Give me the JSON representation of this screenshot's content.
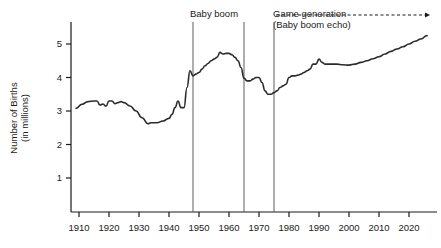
{
  "chart_data": {
    "type": "line",
    "title": "",
    "xlabel": "",
    "ylabel": "Number of Births\n(in millions)",
    "ylabel_lines": [
      "Number of Births",
      "(in millions)"
    ],
    "xlim": [
      1909,
      2027
    ],
    "ylim": [
      0,
      5.6
    ],
    "xticks": [
      1910,
      1920,
      1930,
      1940,
      1950,
      1960,
      1970,
      1980,
      1990,
      2000,
      2010,
      2020
    ],
    "xtick_labels": [
      "1910",
      "1920",
      "1930",
      "1940",
      "1950",
      "1960",
      "1970",
      "1980",
      "1990",
      "2000",
      "2010",
      "2020"
    ],
    "yticks": [
      1,
      2,
      3,
      4,
      5
    ],
    "ytick_labels": [
      "1",
      "2",
      "3",
      "4",
      "5"
    ],
    "grid": false,
    "legend": "none",
    "line_color": "#2b2b2b",
    "marker_line_color": "#6b6b6b",
    "series": [
      {
        "name": "Number of Births (in millions)",
        "x": [
          1909,
          1911,
          1913,
          1915,
          1916,
          1917,
          1918,
          1919,
          1920,
          1921,
          1922,
          1923,
          1924,
          1925,
          1927,
          1929,
          1931,
          1933,
          1934,
          1936,
          1938,
          1940,
          1941,
          1942,
          1943,
          1944,
          1945,
          1946,
          1947,
          1948,
          1949,
          1950,
          1951,
          1952,
          1953,
          1954,
          1955,
          1956,
          1957,
          1958,
          1959,
          1960,
          1961,
          1962,
          1963,
          1964,
          1965,
          1966,
          1967,
          1968,
          1969,
          1970,
          1971,
          1972,
          1973,
          1974,
          1975,
          1976,
          1977,
          1978,
          1979,
          1980,
          1981,
          1982,
          1983,
          1984,
          1985,
          1986,
          1987,
          1988,
          1989,
          1990,
          1991,
          1992,
          1994,
          1996,
          1998,
          2000,
          2002,
          2004,
          2006,
          2008,
          2010,
          2012,
          2014,
          2016,
          2018,
          2020,
          2022,
          2024,
          2026
        ],
        "y": [
          3.08,
          3.2,
          3.28,
          3.3,
          3.3,
          3.18,
          3.21,
          3.14,
          3.3,
          3.3,
          3.22,
          3.25,
          3.28,
          3.25,
          3.15,
          3.0,
          2.8,
          2.62,
          2.65,
          2.65,
          2.7,
          2.78,
          2.9,
          3.1,
          3.3,
          3.1,
          3.1,
          3.7,
          4.2,
          4.05,
          4.1,
          4.15,
          4.25,
          4.35,
          4.42,
          4.5,
          4.55,
          4.6,
          4.75,
          4.7,
          4.72,
          4.72,
          4.68,
          4.6,
          4.5,
          4.3,
          3.98,
          3.9,
          3.9,
          3.95,
          4.0,
          4.0,
          3.85,
          3.6,
          3.5,
          3.5,
          3.55,
          3.6,
          3.7,
          3.75,
          3.8,
          4.0,
          4.05,
          4.05,
          4.07,
          4.1,
          4.15,
          4.2,
          4.25,
          4.4,
          4.4,
          4.55,
          4.45,
          4.4,
          4.4,
          4.4,
          4.38,
          4.37,
          4.4,
          4.45,
          4.5,
          4.56,
          4.62,
          4.7,
          4.78,
          4.85,
          4.92,
          5.0,
          5.08,
          5.15,
          5.25
        ]
      }
    ],
    "annotations": [
      {
        "id": "baby-boom",
        "label": "Baby boom",
        "start_year": 1948,
        "end_year": 1965
      },
      {
        "id": "game-generation",
        "label": "Game generation",
        "sublabel": "(Baby boom echo)",
        "start_year": 1975,
        "arrow": "dashed-right"
      }
    ],
    "vertical_markers": [
      1948,
      1965,
      1975
    ]
  },
  "figure": {
    "ylabel_line1": "Number of Births",
    "ylabel_line2": "(in millions)",
    "annotation_baby_boom": "Baby boom",
    "annotation_game_generation": "Game generation",
    "annotation_game_generation_sub": "(Baby boom echo)"
  }
}
